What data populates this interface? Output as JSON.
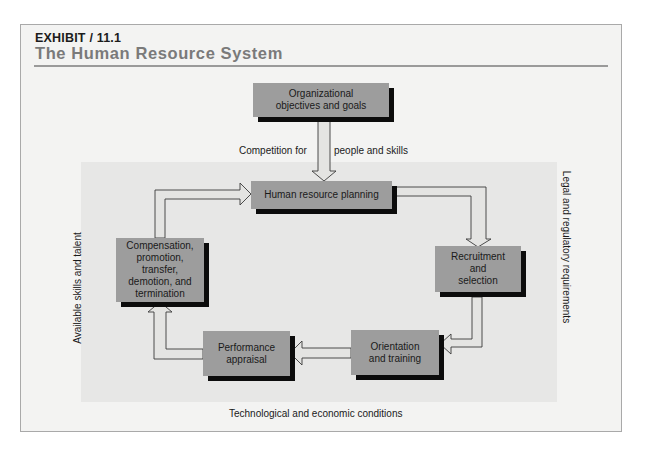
{
  "exhibit": {
    "label": "EXHIBIT / 11.1",
    "title": "The Human Resource System"
  },
  "boxes": {
    "objectives": "Organizational objectives and goals",
    "planning": "Human resource planning",
    "recruitment": "Recruitment and selection",
    "orientation": "Orientation and training",
    "performance": "Performance appraisal",
    "compensation": "Compensation, promotion, transfer, demotion, and termination"
  },
  "environment_labels": {
    "top_left": "Competition for",
    "top_right": "people and skills",
    "left": "Available skills and talent",
    "right": "Legal and regulatory requirements",
    "bottom": "Technological and economic conditions"
  },
  "colors": {
    "box_fill": "#9d9d9d",
    "box_shadow": "#0c0c0c",
    "panel_bg": "#f3f3f2",
    "environment_bg": "#e7e7e6",
    "arrow_fill": "#e4e4e2",
    "title_gray": "#7a7a7a"
  },
  "flow": [
    "Organizational objectives and goals",
    "Human resource planning",
    "Recruitment and selection",
    "Orientation and training",
    "Performance appraisal",
    "Compensation, promotion, transfer, demotion, and termination",
    "Human resource planning"
  ]
}
